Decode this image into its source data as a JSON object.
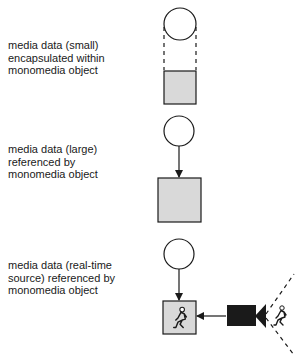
{
  "rows": [
    {
      "label_lines": [
        "media data (small)",
        "encapsulated within",
        "monomedia object"
      ],
      "relation": "encapsulated"
    },
    {
      "label_lines": [
        "media data (large)",
        "referenced by",
        "monomedia object"
      ],
      "relation": "referenced"
    },
    {
      "label_lines": [
        "media data (real-time",
        "source) referenced by",
        "monomedia object"
      ],
      "relation": "real-time source"
    }
  ],
  "icons": {
    "object": "circle-icon",
    "media_data": "gray-square",
    "camera": "video-camera-icon",
    "person": "running-person-icon"
  },
  "colors": {
    "stroke": "#1a1a1a",
    "fill_media": "#d9d9d9",
    "background": "#ffffff"
  }
}
